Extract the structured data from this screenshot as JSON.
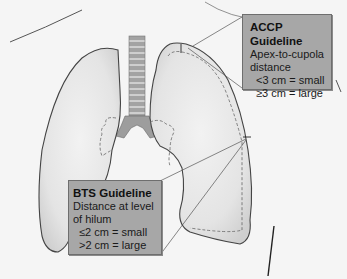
{
  "figure": {
    "colors": {
      "background": "#f5f5f5",
      "lung_fill": "#e6e6e6",
      "lung_outline": "#4a4a4a",
      "trachea_fill": "#9a9a9a",
      "callout_fill": "#a7a7a7",
      "callout_border": "#6e6e6e",
      "dashed_line": "#666666"
    }
  },
  "callouts": {
    "accp": {
      "title": "ACCP Guideline",
      "lines": [
        "Apex-to-cupola",
        "distance",
        "<3 cm = small",
        "≥3 cm = large"
      ]
    },
    "bts": {
      "title": "BTS Guideline",
      "lines": [
        "Distance at level",
        "of hilum",
        "≤2 cm = small",
        ">2 cm = large"
      ]
    }
  },
  "labels": {
    "left_lung": "left-lung",
    "right_lung": "right-lung",
    "trachea": "trachea"
  }
}
